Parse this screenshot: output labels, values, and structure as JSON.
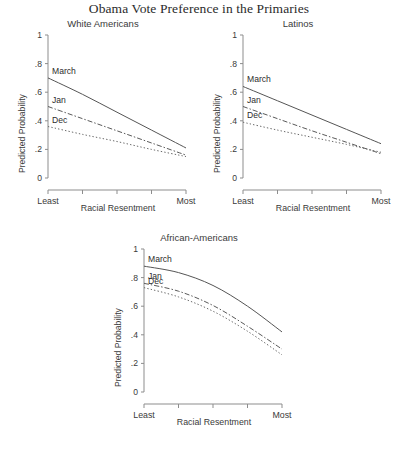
{
  "figure": {
    "title": "Obama Vote Preference in the Primaries",
    "footer_note": ""
  },
  "axes": {
    "ylabel": "Predicted Probability",
    "xlabel": "Racial Resentment",
    "y_ticks": [
      "0",
      ".2",
      ".4",
      ".6",
      ".8",
      "1"
    ],
    "y_tick_values": [
      0,
      0.2,
      0.4,
      0.6,
      0.8,
      1
    ],
    "x_left_label": "Least",
    "x_right_label": "Most",
    "x_tick_count": 5
  },
  "series_labels": {
    "march": "March",
    "jan": "Jan",
    "dec": "Dec"
  },
  "chart_data": [
    {
      "type": "line",
      "title": "White Americans",
      "xlabel": "Racial Resentment",
      "ylabel": "Predicted Probability",
      "ylim": [
        0,
        1
      ],
      "xlim": [
        0,
        1
      ],
      "xtick_labels": [
        "Least",
        "",
        "",
        "",
        "Most"
      ],
      "ytick_labels": [
        "0",
        ".2",
        ".4",
        ".6",
        ".8",
        "1"
      ],
      "grid": false,
      "legend": "inline-labels",
      "x": [
        0,
        0.25,
        0.5,
        0.75,
        1
      ],
      "series": [
        {
          "name": "March",
          "style": "solid",
          "values": [
            0.7,
            0.585,
            0.46,
            0.335,
            0.21
          ]
        },
        {
          "name": "Jan",
          "style": "dashdot",
          "values": [
            0.5,
            0.415,
            0.33,
            0.245,
            0.16
          ]
        },
        {
          "name": "Dec",
          "style": "dotted",
          "values": [
            0.36,
            0.305,
            0.255,
            0.2,
            0.15
          ]
        }
      ]
    },
    {
      "type": "line",
      "title": "Latinos",
      "xlabel": "Racial Resentment",
      "ylabel": "Predicted Probability",
      "ylim": [
        0,
        1
      ],
      "xlim": [
        0,
        1
      ],
      "xtick_labels": [
        "Least",
        "",
        "",
        "",
        "Most"
      ],
      "ytick_labels": [
        "0",
        ".2",
        ".4",
        ".6",
        ".8",
        "1"
      ],
      "grid": false,
      "legend": "inline-labels",
      "x": [
        0,
        0.25,
        0.5,
        0.75,
        1
      ],
      "series": [
        {
          "name": "March",
          "style": "solid",
          "values": [
            0.64,
            0.54,
            0.44,
            0.34,
            0.24
          ]
        },
        {
          "name": "Jan",
          "style": "dashdot",
          "values": [
            0.5,
            0.415,
            0.33,
            0.25,
            0.17
          ]
        },
        {
          "name": "Dec",
          "style": "dotted",
          "values": [
            0.39,
            0.335,
            0.285,
            0.235,
            0.18
          ]
        }
      ]
    },
    {
      "type": "line",
      "title": "African-Americans",
      "xlabel": "Racial Resentment",
      "ylabel": "Predicted Probability",
      "ylim": [
        0,
        1
      ],
      "xlim": [
        0,
        1
      ],
      "xtick_labels": [
        "Least",
        "",
        "",
        "",
        "Most"
      ],
      "ytick_labels": [
        "0",
        ".2",
        ".4",
        ".6",
        ".8",
        "1"
      ],
      "grid": false,
      "legend": "inline-labels",
      "x": [
        0,
        0.25,
        0.5,
        0.75,
        1
      ],
      "series": [
        {
          "name": "March",
          "style": "solid",
          "values": [
            0.88,
            0.835,
            0.745,
            0.6,
            0.42
          ]
        },
        {
          "name": "Jan",
          "style": "dashdot",
          "values": [
            0.76,
            0.705,
            0.605,
            0.46,
            0.3
          ]
        },
        {
          "name": "Dec",
          "style": "dotted",
          "values": [
            0.73,
            0.665,
            0.565,
            0.425,
            0.26
          ]
        }
      ]
    }
  ]
}
